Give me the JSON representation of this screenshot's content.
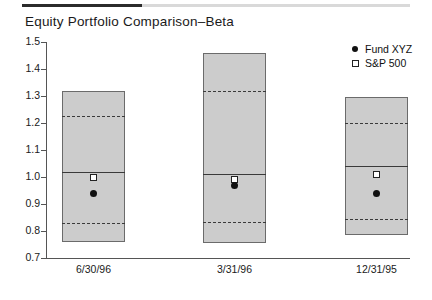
{
  "chart_data": {
    "type": "bar",
    "title": "Equity Portfolio Comparison–Beta",
    "xlabel": "",
    "ylabel": "",
    "ylim": [
      0.7,
      1.5
    ],
    "ytick_labels": [
      "1.5",
      "1.4",
      "1.3",
      "1.2",
      "1.1",
      "1.0",
      "0.9",
      "0.8",
      "0.7"
    ],
    "ytick_values": [
      1.5,
      1.4,
      1.3,
      1.2,
      1.1,
      1.0,
      0.9,
      0.8,
      0.7
    ],
    "grid": false,
    "legend_position": "top-right",
    "categories": [
      "6/30/96",
      "3/31/96",
      "12/31/95"
    ],
    "series": [
      {
        "name": "Range box",
        "kind": "box",
        "top": [
          1.32,
          1.46,
          1.295
        ],
        "upper_dashed": [
          1.225,
          1.32,
          1.2
        ],
        "median": [
          1.02,
          1.01,
          1.04
        ],
        "lower_dashed": [
          0.83,
          0.835,
          0.845
        ],
        "bottom": [
          0.76,
          0.755,
          0.785
        ]
      },
      {
        "name": "Fund XYZ",
        "kind": "point",
        "marker": "filled-circle",
        "values": [
          0.94,
          0.97,
          0.94
        ]
      },
      {
        "name": "S&P 500",
        "kind": "point",
        "marker": "open-square",
        "values": [
          1.0,
          0.99,
          1.01
        ]
      }
    ]
  },
  "legend": {
    "items": [
      {
        "label": "Fund XYZ",
        "marker": "filled-circle-icon"
      },
      {
        "label": "S&P 500",
        "marker": "open-square-icon"
      }
    ]
  },
  "colors": {
    "box_fill": "#cccccc",
    "box_border": "#6b6b6b",
    "line": "#3a3a3a",
    "axis": "#555555",
    "rule_dark": "#2b2b2b",
    "rule_light": "#d9d9d9",
    "text": "#1a1a1a"
  }
}
